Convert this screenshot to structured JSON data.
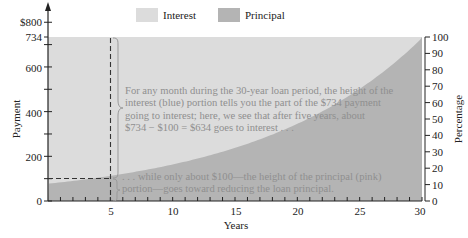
{
  "chart_data": {
    "type": "area",
    "title": "",
    "xlabel": "Years",
    "ylabel": "Payment",
    "y2label": "Percentage",
    "xlim": [
      0,
      30
    ],
    "ylim": [
      0,
      800
    ],
    "y2lim": [
      0,
      100
    ],
    "x_ticks": [
      "5",
      "10",
      "15",
      "20",
      "25",
      "30"
    ],
    "y_ticks": [
      "0",
      "200",
      "400",
      "600",
      "734",
      "$800"
    ],
    "y2_ticks": [
      "0",
      "10",
      "20",
      "30",
      "40",
      "50",
      "60",
      "70",
      "80",
      "90",
      "100"
    ],
    "monthly_payment": 734,
    "legend": [
      {
        "name": "Interest",
        "color": "#dcdcdc"
      },
      {
        "name": "Principal",
        "color": "#b4b4b4"
      }
    ],
    "x": [
      0,
      2.5,
      5,
      7.5,
      10,
      12.5,
      15,
      17.5,
      20,
      22.5,
      25,
      27.5,
      30
    ],
    "series": [
      {
        "name": "Principal",
        "values": [
          78,
          94,
          113,
          136,
          164,
          197,
          238,
          286,
          345,
          416,
          502,
          605,
          734
        ]
      },
      {
        "name": "Interest",
        "values": [
          656,
          640,
          621,
          598,
          570,
          537,
          496,
          448,
          389,
          318,
          232,
          129,
          0
        ]
      }
    ],
    "annotations": [
      {
        "x": 5,
        "text": "For any month during the 30-year loan period, the height of the interest (blue) portion tells you the part of the $734 payment going to interest; here, we see that after five years, about $734 − $100 = $634 goes to interest . . ."
      },
      {
        "x": 5,
        "text": ". . . while only about $100—the height of the principal (pink) portion—goes toward reducing the loan principal."
      }
    ],
    "grid": false,
    "legend_position": "top"
  },
  "legend": {
    "interest": "Interest",
    "principal": "Principal"
  },
  "axes": {
    "x_title": "Years",
    "y_title": "Payment",
    "y2_title": "Percentage",
    "x_ticks": [
      "5",
      "10",
      "15",
      "20",
      "25",
      "30"
    ],
    "y_ticks": {
      "t0": "0",
      "t200": "200",
      "t400": "400",
      "t600": "600",
      "t734": "734",
      "t800": "$800"
    },
    "y2_ticks": [
      "0",
      "10",
      "20",
      "30",
      "40",
      "50",
      "60",
      "70",
      "80",
      "90",
      "100"
    ]
  },
  "annotation_interest": [
    "For any month during the 30-year loan period, the height of the",
    "interest (blue) portion tells you the part of the $734 payment",
    "going to interest; here, we see that after five years, about",
    "$734 − $100 = $634 goes to interest . . ."
  ],
  "annotation_principal": [
    ". . . while only about $100—the height of the principal (pink)",
    "portion—goes toward reducing the loan principal."
  ],
  "colors": {
    "interest": "#dcdcdc",
    "principal": "#b4b4b4",
    "axis": "#222222",
    "annotation_text": "#8f8f8f"
  }
}
